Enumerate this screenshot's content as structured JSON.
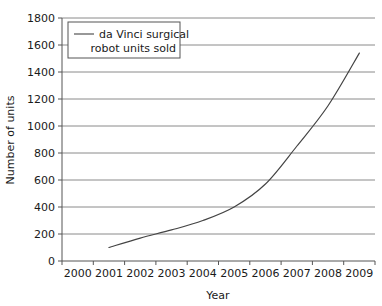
{
  "chart_data": {
    "type": "line",
    "title": "",
    "xlabel": "Year",
    "ylabel": "Number of units",
    "xlim": [
      2000,
      2009
    ],
    "ylim": [
      0,
      1800
    ],
    "ytick_step": 200,
    "grid": true,
    "grid_axis": "y",
    "legend_position": "top-left",
    "xticklabels": [
      "2000",
      "2001",
      "2002",
      "2003",
      "2004",
      "2005",
      "2006",
      "2007",
      "2008",
      "2009"
    ],
    "yticklabels": [
      "0",
      "200",
      "400",
      "600",
      "800",
      "1000",
      "1200",
      "1400",
      "1600",
      "1800"
    ],
    "series": [
      {
        "name": "da Vinci surgical robot units sold",
        "color": "#444444",
        "x": [
          2001,
          2002,
          2003,
          2004,
          2005,
          2006,
          2007,
          2008,
          2009
        ],
        "values": [
          100,
          170,
          230,
          300,
          400,
          570,
          850,
          1150,
          1540
        ]
      }
    ]
  },
  "legend": {
    "entries": [
      {
        "line1": "da Vinci surgical",
        "line2": "robot units sold",
        "swatch_color": "#444444"
      }
    ]
  },
  "axes": {
    "x_title": "Year",
    "y_title": "Number of units"
  }
}
